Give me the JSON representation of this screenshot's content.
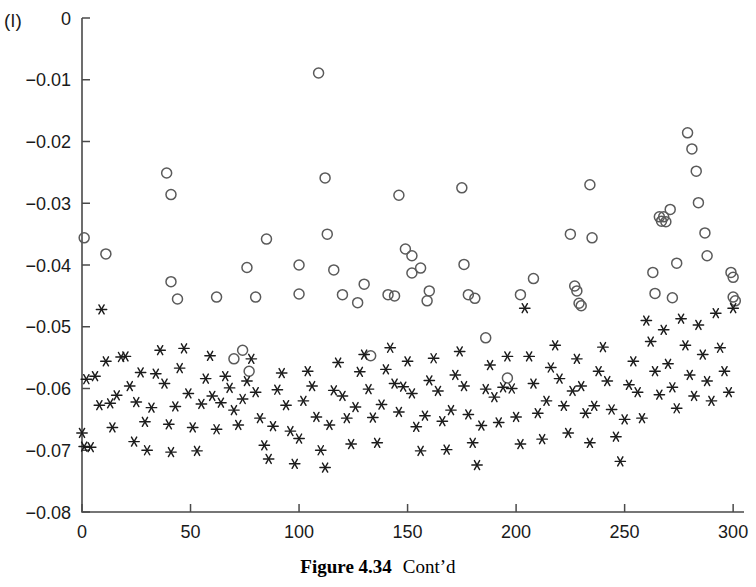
{
  "panel": {
    "label": "(l)"
  },
  "caption": {
    "figure_number": "Figure 4.34",
    "note": "Cont’d"
  },
  "colors": {
    "axis": "#4a4a4a",
    "circle_marker": "#5a5a5a",
    "star_marker": "#1c1c1c",
    "text": "#1a1a1a",
    "background": "#ffffff"
  },
  "chart_data": {
    "type": "scatter",
    "title": "",
    "xlabel": "",
    "ylabel": "",
    "xlim": [
      0,
      305
    ],
    "ylim": [
      -0.08,
      0
    ],
    "grid": false,
    "legend": "none",
    "xticks": [
      0,
      50,
      100,
      150,
      200,
      250,
      300
    ],
    "xtick_labels": [
      "0",
      "50",
      "100",
      "150",
      "200",
      "250",
      "300"
    ],
    "yticks": [
      0,
      -0.01,
      -0.02,
      -0.03,
      -0.04,
      -0.05,
      -0.06,
      -0.07,
      -0.08
    ],
    "ytick_labels": [
      "0",
      "−0.01",
      "−0.02",
      "−0.03",
      "−0.04",
      "−0.05",
      "−0.06",
      "−0.07",
      "−0.08"
    ],
    "series": [
      {
        "name": "open-circles",
        "marker": "circle-open",
        "points": [
          [
            1,
            -0.0356
          ],
          [
            11,
            -0.0382
          ],
          [
            39,
            -0.0251
          ],
          [
            41,
            -0.0286
          ],
          [
            41,
            -0.0427
          ],
          [
            44,
            -0.0455
          ],
          [
            62,
            -0.0452
          ],
          [
            70,
            -0.0552
          ],
          [
            74,
            -0.0538
          ],
          [
            76,
            -0.0404
          ],
          [
            77,
            -0.0572
          ],
          [
            80,
            -0.0452
          ],
          [
            85,
            -0.0358
          ],
          [
            100,
            -0.04
          ],
          [
            100,
            -0.0447
          ],
          [
            109,
            -0.0089
          ],
          [
            112,
            -0.0259
          ],
          [
            113,
            -0.035
          ],
          [
            116,
            -0.0408
          ],
          [
            120,
            -0.0448
          ],
          [
            127,
            -0.0461
          ],
          [
            130,
            -0.0431
          ],
          [
            133,
            -0.0547
          ],
          [
            141,
            -0.0448
          ],
          [
            144,
            -0.045
          ],
          [
            146,
            -0.0287
          ],
          [
            149,
            -0.0374
          ],
          [
            152,
            -0.0385
          ],
          [
            152,
            -0.0413
          ],
          [
            156,
            -0.0405
          ],
          [
            159,
            -0.0458
          ],
          [
            160,
            -0.0442
          ],
          [
            175,
            -0.0275
          ],
          [
            176,
            -0.0399
          ],
          [
            178,
            -0.0448
          ],
          [
            181,
            -0.0454
          ],
          [
            186,
            -0.0518
          ],
          [
            196,
            -0.0583
          ],
          [
            202,
            -0.0448
          ],
          [
            208,
            -0.0422
          ],
          [
            225,
            -0.035
          ],
          [
            227,
            -0.0434
          ],
          [
            228,
            -0.0442
          ],
          [
            229,
            -0.0462
          ],
          [
            230,
            -0.0466
          ],
          [
            234,
            -0.027
          ],
          [
            235,
            -0.0356
          ],
          [
            263,
            -0.0412
          ],
          [
            264,
            -0.0446
          ],
          [
            266,
            -0.0322
          ],
          [
            267,
            -0.0329
          ],
          [
            268,
            -0.0322
          ],
          [
            269,
            -0.033
          ],
          [
            271,
            -0.031
          ],
          [
            272,
            -0.0453
          ],
          [
            274,
            -0.0397
          ],
          [
            279,
            -0.0186
          ],
          [
            281,
            -0.0212
          ],
          [
            283,
            -0.0248
          ],
          [
            284,
            -0.0299
          ],
          [
            287,
            -0.0348
          ],
          [
            288,
            -0.0385
          ],
          [
            299,
            -0.0412
          ],
          [
            300,
            -0.042
          ],
          [
            300,
            -0.0452
          ],
          [
            301,
            -0.0458
          ]
        ]
      },
      {
        "name": "asterisks",
        "marker": "asterisk",
        "points": [
          [
            0,
            -0.0672
          ],
          [
            1,
            -0.0694
          ],
          [
            2,
            -0.0585
          ],
          [
            4,
            -0.0695
          ],
          [
            6,
            -0.058
          ],
          [
            8,
            -0.0627
          ],
          [
            9,
            -0.0472
          ],
          [
            11,
            -0.0556
          ],
          [
            13,
            -0.0624
          ],
          [
            14,
            -0.0663
          ],
          [
            16,
            -0.0611
          ],
          [
            18,
            -0.0549
          ],
          [
            20,
            -0.0548
          ],
          [
            22,
            -0.0596
          ],
          [
            24,
            -0.0686
          ],
          [
            25,
            -0.0622
          ],
          [
            27,
            -0.0574
          ],
          [
            29,
            -0.0654
          ],
          [
            30,
            -0.07
          ],
          [
            32,
            -0.0631
          ],
          [
            34,
            -0.0576
          ],
          [
            36,
            -0.0538
          ],
          [
            38,
            -0.0592
          ],
          [
            40,
            -0.0658
          ],
          [
            41,
            -0.0703
          ],
          [
            43,
            -0.0629
          ],
          [
            45,
            -0.0567
          ],
          [
            47,
            -0.0535
          ],
          [
            49,
            -0.0608
          ],
          [
            51,
            -0.0663
          ],
          [
            53,
            -0.0701
          ],
          [
            55,
            -0.0625
          ],
          [
            57,
            -0.0584
          ],
          [
            59,
            -0.0547
          ],
          [
            60,
            -0.0612
          ],
          [
            62,
            -0.0666
          ],
          [
            64,
            -0.0623
          ],
          [
            66,
            -0.058
          ],
          [
            68,
            -0.0599
          ],
          [
            70,
            -0.0635
          ],
          [
            72,
            -0.0659
          ],
          [
            74,
            -0.0617
          ],
          [
            76,
            -0.0588
          ],
          [
            78,
            -0.0552
          ],
          [
            80,
            -0.0606
          ],
          [
            82,
            -0.0648
          ],
          [
            84,
            -0.0692
          ],
          [
            86,
            -0.0714
          ],
          [
            88,
            -0.0661
          ],
          [
            90,
            -0.0602
          ],
          [
            92,
            -0.0575
          ],
          [
            94,
            -0.0627
          ],
          [
            96,
            -0.0669
          ],
          [
            98,
            -0.0722
          ],
          [
            100,
            -0.0681
          ],
          [
            102,
            -0.062
          ],
          [
            104,
            -0.0572
          ],
          [
            106,
            -0.0596
          ],
          [
            108,
            -0.0646
          ],
          [
            110,
            -0.07
          ],
          [
            112,
            -0.0728
          ],
          [
            114,
            -0.0659
          ],
          [
            116,
            -0.0603
          ],
          [
            118,
            -0.0558
          ],
          [
            120,
            -0.0612
          ],
          [
            122,
            -0.0648
          ],
          [
            124,
            -0.069
          ],
          [
            126,
            -0.063
          ],
          [
            128,
            -0.0573
          ],
          [
            130,
            -0.0545
          ],
          [
            132,
            -0.0601
          ],
          [
            134,
            -0.0647
          ],
          [
            136,
            -0.0688
          ],
          [
            138,
            -0.0626
          ],
          [
            140,
            -0.0569
          ],
          [
            142,
            -0.0534
          ],
          [
            144,
            -0.0592
          ],
          [
            146,
            -0.0638
          ],
          [
            148,
            -0.0597
          ],
          [
            150,
            -0.0556
          ],
          [
            152,
            -0.0608
          ],
          [
            154,
            -0.0662
          ],
          [
            156,
            -0.0701
          ],
          [
            158,
            -0.0644
          ],
          [
            160,
            -0.0587
          ],
          [
            162,
            -0.0551
          ],
          [
            164,
            -0.0604
          ],
          [
            166,
            -0.0653
          ],
          [
            168,
            -0.0699
          ],
          [
            170,
            -0.0635
          ],
          [
            172,
            -0.0578
          ],
          [
            174,
            -0.054
          ],
          [
            176,
            -0.0596
          ],
          [
            178,
            -0.0642
          ],
          [
            180,
            -0.0688
          ],
          [
            182,
            -0.0724
          ],
          [
            184,
            -0.066
          ],
          [
            186,
            -0.0601
          ],
          [
            188,
            -0.0562
          ],
          [
            190,
            -0.0614
          ],
          [
            192,
            -0.0655
          ],
          [
            194,
            -0.0598
          ],
          [
            196,
            -0.0548
          ],
          [
            198,
            -0.06
          ],
          [
            200,
            -0.0646
          ],
          [
            202,
            -0.069
          ],
          [
            204,
            -0.047
          ],
          [
            206,
            -0.0548
          ],
          [
            208,
            -0.0592
          ],
          [
            210,
            -0.064
          ],
          [
            212,
            -0.0682
          ],
          [
            214,
            -0.062
          ],
          [
            216,
            -0.0566
          ],
          [
            218,
            -0.053
          ],
          [
            220,
            -0.0584
          ],
          [
            222,
            -0.0628
          ],
          [
            224,
            -0.0672
          ],
          [
            226,
            -0.0604
          ],
          [
            228,
            -0.0552
          ],
          [
            230,
            -0.0596
          ],
          [
            232,
            -0.064
          ],
          [
            234,
            -0.0688
          ],
          [
            236,
            -0.0628
          ],
          [
            238,
            -0.0572
          ],
          [
            240,
            -0.0533
          ],
          [
            242,
            -0.0588
          ],
          [
            244,
            -0.0634
          ],
          [
            246,
            -0.0678
          ],
          [
            248,
            -0.0718
          ],
          [
            250,
            -0.065
          ],
          [
            252,
            -0.0594
          ],
          [
            254,
            -0.0556
          ],
          [
            256,
            -0.0606
          ],
          [
            258,
            -0.0648
          ],
          [
            260,
            -0.049
          ],
          [
            262,
            -0.0524
          ],
          [
            264,
            -0.0572
          ],
          [
            266,
            -0.061
          ],
          [
            268,
            -0.0505
          ],
          [
            270,
            -0.056
          ],
          [
            272,
            -0.0598
          ],
          [
            274,
            -0.0632
          ],
          [
            276,
            -0.0487
          ],
          [
            278,
            -0.053
          ],
          [
            280,
            -0.0578
          ],
          [
            282,
            -0.0612
          ],
          [
            284,
            -0.0497
          ],
          [
            286,
            -0.0545
          ],
          [
            288,
            -0.0588
          ],
          [
            290,
            -0.062
          ],
          [
            292,
            -0.0478
          ],
          [
            294,
            -0.0534
          ],
          [
            296,
            -0.0572
          ],
          [
            298,
            -0.0606
          ],
          [
            300,
            -0.047
          ]
        ]
      }
    ]
  }
}
